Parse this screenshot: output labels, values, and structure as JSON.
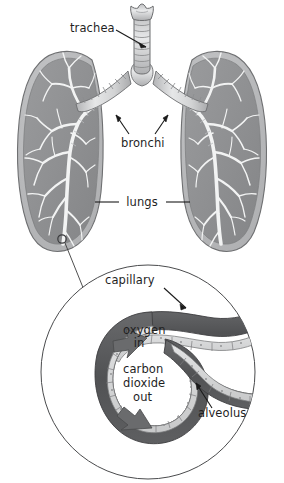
{
  "figure": {
    "background_color": "#ffffff",
    "colors": {
      "lung_fill": "#8f9092",
      "lung_rim": "#b9babc",
      "lung_outline": "#6f7072",
      "airway_light": "#dedfe0",
      "airway_mid": "#b5b6b8",
      "airway_outline": "#6d6e70",
      "capillary_wall": "#565759",
      "alveolus_wall": "#d8d9da",
      "alveolus_cell_line": "#7c7d7f",
      "arrow_fill": "#6a6b6d",
      "magnifier_outline": "#4a4b4d",
      "label_text": "#1f1f1f",
      "leader_line": "#1a1a1a"
    }
  },
  "labels": {
    "trachea": "trachea",
    "bronchi": "bronchi",
    "lungs": "lungs",
    "capillary": "capillary",
    "oxygen_in_line1": "oxygen",
    "oxygen_in_line2": "in",
    "carbon_dioxide_out_line1": "carbon",
    "carbon_dioxide_out_line2": "dioxide",
    "carbon_dioxide_out_line3": "out",
    "alveolus": "alveolus"
  },
  "structures": {
    "upper": [
      {
        "name": "trachea",
        "description": "segmented cartilage tube with flared larynx at top, vertical center"
      },
      {
        "name": "left-lung",
        "description": "gray lobe on viewer left with white bronchial tree"
      },
      {
        "name": "right-lung",
        "description": "gray lobe on viewer right with white bronchial tree"
      },
      {
        "name": "left-bronchus",
        "description": "segmented tube branching down-left from trachea"
      },
      {
        "name": "right-bronchus",
        "description": "segmented tube branching down-right from trachea"
      },
      {
        "name": "magnifier-marker",
        "description": "small open circle on lower left lung indicating magnified region"
      }
    ],
    "detail": [
      {
        "name": "magnifier-circle",
        "description": "large thin-outlined circle containing magnified alveolus"
      },
      {
        "name": "alveolus",
        "description": "C-shaped air sac with segmented epithelial cells"
      },
      {
        "name": "capillary",
        "description": "dark gray blood vessels wrapping the alveolus and extending right"
      },
      {
        "name": "oxygen-in-arrow",
        "description": "arrow pointing into alveolus interior, upper left"
      },
      {
        "name": "carbon-dioxide-out-arrow",
        "description": "arrow pointing out of alveolus, lower left"
      }
    ]
  },
  "leader_lines": {
    "trachea": "arrow from label right side up-right to trachea tube",
    "bronchi": "two arrows from label up-left and up-right to each bronchus",
    "lungs": "dash left to left lung and dash right to right lung",
    "capillary": "arrow from label down-right to capillary wall",
    "alveolus": "arrow from label up-left to alveolus wall",
    "magnifier": "line from small circle on left lung down-right to magnifier circle edge"
  }
}
